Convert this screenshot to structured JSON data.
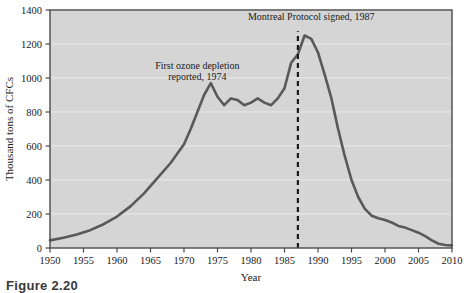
{
  "figure": {
    "caption": "Figure 2.20",
    "background_color": "#ffffff",
    "plot_background_color": "#d5d5d5",
    "line_color": "#595959",
    "grid_color": "#eaeaea",
    "axis_color": "#4a4a4a"
  },
  "chart_data": {
    "type": "line",
    "title": "",
    "xlabel": "Year",
    "ylabel": "Thousand tons of CFCs",
    "xlim": [
      1950,
      2010
    ],
    "ylim": [
      0,
      1400
    ],
    "grid": true,
    "legend": "none",
    "xticks": [
      1950,
      1955,
      1960,
      1965,
      1970,
      1975,
      1980,
      1985,
      1990,
      1995,
      2000,
      2005,
      2010
    ],
    "yticks": [
      0,
      200,
      400,
      600,
      800,
      1000,
      1200,
      1400
    ],
    "xtick_labels": [
      "1950",
      "1955",
      "1960",
      "1965",
      "1970",
      "1975",
      "1980",
      "1985",
      "1990",
      "1995",
      "2000",
      "2005",
      "2010"
    ],
    "ytick_labels": [
      "0",
      "200",
      "400",
      "600",
      "800",
      "1000",
      "1200",
      "1400"
    ],
    "series": [
      {
        "name": "CFC production",
        "x": [
          1950,
          1952,
          1954,
          1956,
          1958,
          1960,
          1962,
          1964,
          1966,
          1968,
          1970,
          1971,
          1972,
          1973,
          1974,
          1975,
          1976,
          1977,
          1978,
          1979,
          1980,
          1981,
          1982,
          1983,
          1984,
          1985,
          1986,
          1987,
          1988,
          1989,
          1990,
          1991,
          1992,
          1993,
          1994,
          1995,
          1996,
          1997,
          1998,
          1999,
          2000,
          2001,
          2002,
          2003,
          2004,
          2005,
          2006,
          2007,
          2008,
          2009,
          2010
        ],
        "values": [
          45,
          60,
          80,
          105,
          140,
          185,
          245,
          320,
          410,
          500,
          610,
          700,
          800,
          900,
          970,
          890,
          840,
          880,
          870,
          840,
          855,
          880,
          855,
          840,
          880,
          940,
          1090,
          1140,
          1250,
          1230,
          1150,
          1020,
          880,
          700,
          540,
          400,
          300,
          230,
          190,
          175,
          165,
          150,
          130,
          120,
          105,
          90,
          70,
          45,
          25,
          18,
          15
        ]
      }
    ],
    "annotations": [
      {
        "name": "first-ozone-depletion",
        "text_lines": [
          "First ozone depletion",
          "reported, 1974"
        ],
        "x": 1972,
        "y": 1055
      },
      {
        "name": "montreal-protocol",
        "text_lines": [
          "Montreal Protocol signed, 1987"
        ],
        "x": 1989,
        "y": 1340
      }
    ],
    "markers": [
      {
        "name": "montreal-protocol-line",
        "type": "vertical-dashed-line",
        "x": 1987,
        "y_start": 0,
        "y_end": 1275,
        "color": "#1a1a1a"
      }
    ]
  }
}
